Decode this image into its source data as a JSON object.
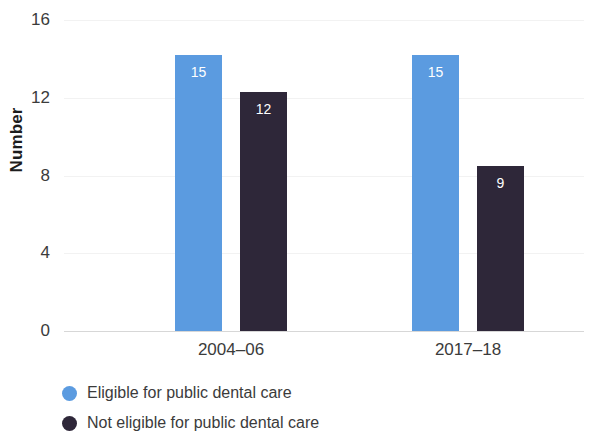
{
  "chart_data": {
    "type": "bar",
    "title": "",
    "xlabel": "",
    "ylabel": "Number",
    "categories": [
      "2004–06",
      "2017–18"
    ],
    "series": [
      {
        "name": "Eligible for public dental care",
        "color": "#5b9be0",
        "values": [
          15,
          15
        ],
        "bar_tops": [
          14.2,
          14.2
        ]
      },
      {
        "name": "Not eligible for public dental care",
        "color": "#2e2739",
        "values": [
          12,
          9
        ],
        "bar_tops": [
          12.3,
          8.5
        ]
      }
    ],
    "ylim": [
      0,
      16
    ],
    "yticks": [
      0,
      4,
      8,
      12,
      16
    ],
    "ytick_labels": [
      "0",
      "4",
      "8",
      "12",
      "16"
    ],
    "grid": true,
    "legend_position": "bottom-left"
  },
  "legend": {
    "items": [
      {
        "label": "Eligible for public dental care",
        "color": "#5b9be0"
      },
      {
        "label": "Not eligible for public dental care",
        "color": "#2e2739"
      }
    ]
  }
}
